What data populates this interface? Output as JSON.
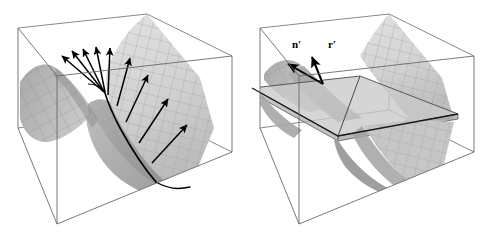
{
  "figure": {
    "type": "math-illustration",
    "panel_count": 2,
    "background_color": "#ffffff"
  },
  "colors": {
    "background": "#ffffff",
    "box_wireframe": "#555555",
    "surface_light": "#dcdcdc",
    "surface_mid": "#c4c4c4",
    "surface_dark": "#9a9a9a",
    "surface_darkest": "#8a8a8a",
    "mesh_line": "#9c9c9c",
    "plane_fill": "#c9c9c9",
    "arrow": "#000000",
    "curve_highlight": "#000000",
    "label_text": "#000000"
  },
  "panels": [
    {
      "id": "left",
      "name": "saddle-with-normal-vectors",
      "has_tangent_plane": false,
      "arrow_count": 9,
      "labels": [],
      "surface_name": "hyperbolic-paraboloid",
      "highlight_curve": "principal-direction-curve"
    },
    {
      "id": "right",
      "name": "saddle-with-tangent-plane",
      "has_tangent_plane": true,
      "arrow_count": 2,
      "labels": [
        {
          "id": "n-prime",
          "text": "n′",
          "x": 54,
          "y": 44
        },
        {
          "id": "r-prime",
          "text": "r′",
          "x": 89,
          "y": 44
        }
      ],
      "surface_name": "hyperbolic-paraboloid",
      "highlight_curve": "plane-surface-intersection"
    }
  ],
  "box": {
    "name": "wireframe-bounding-box",
    "vertices_note": "axonometric cube drawn with thin gray lines",
    "corners": {
      "top_back": [
        147,
        14
      ],
      "top_left": [
        18,
        28
      ],
      "top_right": [
        232,
        56
      ],
      "top_front": [
        57,
        76
      ],
      "bot_back": [
        147,
        110
      ],
      "bot_left": [
        18,
        128
      ],
      "bot_right": [
        232,
        152
      ],
      "bot_front": [
        57,
        224
      ]
    }
  },
  "left_arrows": [
    {
      "id": "normal-1",
      "x1": 104,
      "y1": 92,
      "x2": 62,
      "y2": 56
    },
    {
      "id": "normal-2",
      "x1": 104,
      "y1": 92,
      "x2": 72,
      "y2": 51
    },
    {
      "id": "normal-3",
      "x1": 104,
      "y1": 92,
      "x2": 83,
      "y2": 49
    },
    {
      "id": "normal-4",
      "x1": 105,
      "y1": 92,
      "x2": 96,
      "y2": 47
    },
    {
      "id": "normal-5",
      "x1": 108,
      "y1": 95,
      "x2": 110,
      "y2": 48
    },
    {
      "id": "normal-6",
      "x1": 117,
      "y1": 106,
      "x2": 130,
      "y2": 58
    },
    {
      "id": "normal-7",
      "x1": 126,
      "y1": 122,
      "x2": 148,
      "y2": 75
    },
    {
      "id": "normal-8",
      "x1": 139,
      "y1": 143,
      "x2": 168,
      "y2": 99
    },
    {
      "id": "normal-9",
      "x1": 152,
      "y1": 163,
      "x2": 187,
      "y2": 125
    }
  ],
  "right_arrows": [
    {
      "id": "n-prime-arrow",
      "x1": 81,
      "y1": 84,
      "x2": 46,
      "y2": 64
    },
    {
      "id": "r-prime-arrow",
      "x1": 81,
      "y1": 84,
      "x2": 70,
      "y2": 57
    }
  ]
}
